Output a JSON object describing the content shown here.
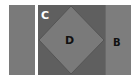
{
  "diagram": {
    "labels": {
      "c": "C",
      "d": "D",
      "b": "B"
    },
    "colors": {
      "background": "#ffffff",
      "left_rect": "#7a7a7a",
      "outer_square": "#5f5f5f",
      "diamond": "#7a7a7a",
      "b_rect": "#7d7d7d"
    }
  }
}
